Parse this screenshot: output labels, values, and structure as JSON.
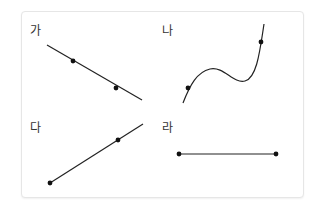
{
  "panels": [
    {
      "label": "가",
      "type": "straight-line-decreasing",
      "line": {
        "x1": 47,
        "y1": 45,
        "x2": 142,
        "y2": 100
      },
      "points": [
        {
          "x": 73,
          "y": 61
        },
        {
          "x": 116,
          "y": 88
        }
      ]
    },
    {
      "label": "나",
      "type": "cubic-curve",
      "path": "M183,103 C190,85 197,72 210,69 C224,66 233,84 245,81 C257,78 260,50 264,24",
      "points": [
        {
          "x": 188,
          "y": 88
        },
        {
          "x": 261,
          "y": 42
        }
      ]
    },
    {
      "label": "다",
      "type": "straight-line-increasing",
      "line": {
        "x1": 50,
        "y1": 183,
        "x2": 143,
        "y2": 124
      },
      "points": [
        {
          "x": 50,
          "y": 183
        },
        {
          "x": 118,
          "y": 140
        }
      ]
    },
    {
      "label": "라",
      "type": "horizontal-segment",
      "line": {
        "x1": 179,
        "y1": 154,
        "x2": 276,
        "y2": 154
      },
      "points": [
        {
          "x": 179,
          "y": 154
        },
        {
          "x": 276,
          "y": 154
        }
      ]
    }
  ],
  "colors": {
    "stroke": "#222222",
    "text": "#333333",
    "border": "#e6e6e6"
  }
}
